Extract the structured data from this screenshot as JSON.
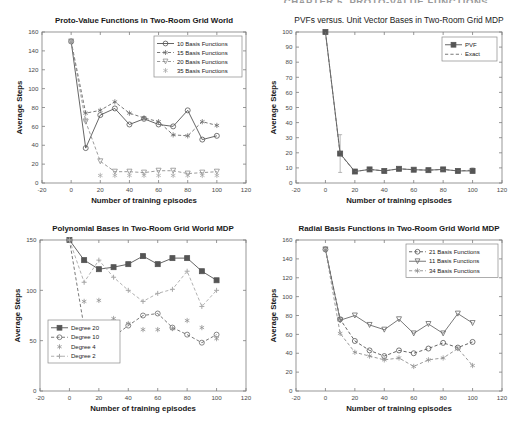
{
  "page": {
    "running_header": "CHAPTER 5.  PROTO-VALUE FUNCTIONS"
  },
  "chart_data": [
    {
      "id": "proto-value-functions",
      "type": "line",
      "title": "Proto-Value Functions in Two-Room Grid World",
      "xlabel": "Number of training episodes",
      "ylabel": "Average Steps",
      "xlim": [
        -20,
        120
      ],
      "ylim": [
        0,
        160
      ],
      "xticks": [
        -20,
        0,
        20,
        40,
        60,
        80,
        100,
        120
      ],
      "yticks": [
        0,
        20,
        40,
        60,
        80,
        100,
        120,
        140,
        160
      ],
      "grid": false,
      "legend_position": "top-right",
      "x": [
        0,
        10,
        20,
        30,
        40,
        50,
        60,
        70,
        80,
        90,
        100
      ],
      "series": [
        {
          "name": "10 Basis Functions",
          "marker": "circle",
          "linestyle": "solid",
          "values": [
            150,
            37,
            72,
            79,
            62,
            68,
            62,
            60,
            77,
            46,
            50
          ]
        },
        {
          "name": "15 Basis Functions",
          "marker": "star",
          "linestyle": "dashed",
          "values": [
            150,
            74,
            77,
            86,
            74,
            69,
            65,
            51,
            50,
            65,
            61
          ]
        },
        {
          "name": "20 Basis Functions",
          "marker": "triangle-down",
          "linestyle": "dashed",
          "values": [
            150,
            65,
            23,
            12,
            12,
            11,
            13,
            13,
            10,
            11,
            12
          ]
        },
        {
          "name": "35 Basis Functions",
          "marker": "star",
          "linestyle": "none",
          "values": [
            150,
            67,
            8,
            8,
            8,
            8,
            8,
            8,
            8,
            8,
            8
          ]
        }
      ]
    },
    {
      "id": "pvfs-vs-unit-vector",
      "type": "line",
      "title": "PVFs versus. Unit Vector Bases in Two-Room Grid MDP",
      "xlabel": "Number of training episodes",
      "ylabel": "Average Steps",
      "xlim": [
        -20,
        120
      ],
      "ylim": [
        0,
        100
      ],
      "xticks": [
        -20,
        0,
        20,
        40,
        60,
        80,
        100,
        120
      ],
      "yticks": [
        0,
        10,
        20,
        30,
        40,
        50,
        60,
        70,
        80,
        90,
        100
      ],
      "grid": false,
      "legend_position": "top-right",
      "x": [
        0,
        10,
        20,
        30,
        40,
        50,
        60,
        70,
        80,
        90,
        100
      ],
      "series": [
        {
          "name": "PVF",
          "marker": "square",
          "linestyle": "solid",
          "values": [
            100,
            19.5,
            7.6,
            9,
            8,
            9.4,
            8.8,
            8.5,
            9,
            8,
            8
          ]
        },
        {
          "name": "Exact",
          "marker": "none",
          "linestyle": "dashed",
          "values": [
            100,
            19,
            7.6,
            9,
            8,
            9.4,
            8.8,
            8.5,
            9,
            8,
            8.5
          ]
        }
      ],
      "errorbars": {
        "x": [
          10,
          100
        ],
        "low": [
          7,
          7
        ],
        "high": [
          32,
          10
        ]
      }
    },
    {
      "id": "polynomial-bases",
      "type": "line",
      "title": "Polynomial Bases in Two-Room Grid World MDP",
      "xlabel": "Number of training episodes",
      "ylabel": "Average Steps",
      "xlim": [
        -20,
        120
      ],
      "ylim": [
        0,
        150
      ],
      "xticks": [
        -20,
        0,
        20,
        40,
        60,
        80,
        100,
        120
      ],
      "yticks": [
        0,
        50,
        100,
        150
      ],
      "grid": false,
      "legend_position": "bottom-left",
      "x": [
        0,
        10,
        20,
        30,
        40,
        50,
        60,
        70,
        80,
        90,
        100
      ],
      "series": [
        {
          "name": "Degree 20",
          "marker": "square",
          "linestyle": "solid",
          "values": [
            150,
            130,
            121,
            123,
            126,
            134,
            126,
            132,
            132,
            119,
            110
          ]
        },
        {
          "name": "Degree 10",
          "marker": "circle",
          "linestyle": "dashed",
          "values": [
            150,
            63,
            66,
            54,
            65,
            75,
            77,
            63,
            56,
            48,
            56
          ]
        },
        {
          "name": "Degree 4",
          "marker": "star",
          "linestyle": "none",
          "values": [
            150,
            89,
            90,
            72,
            67,
            61,
            61,
            62,
            70,
            63,
            52
          ]
        },
        {
          "name": "Degree 2",
          "marker": "plus",
          "linestyle": "dashed",
          "values": [
            150,
            108,
            130,
            113,
            100,
            89,
            97,
            101,
            119,
            84,
            100
          ]
        }
      ]
    },
    {
      "id": "radial-basis-functions",
      "type": "line",
      "title": "Radial Basis Functions in Two-Room Grid World MDP",
      "xlabel": "Number of training episodes",
      "ylabel": "Average Steps",
      "xlim": [
        -20,
        120
      ],
      "ylim": [
        0,
        160
      ],
      "xticks": [
        -20,
        0,
        20,
        40,
        60,
        80,
        100,
        120
      ],
      "yticks": [
        0,
        20,
        40,
        60,
        80,
        100,
        120,
        140,
        160
      ],
      "grid": false,
      "legend_position": "top-right",
      "x": [
        0,
        10,
        20,
        30,
        40,
        50,
        60,
        70,
        80,
        90,
        100
      ],
      "series": [
        {
          "name": "21 Basis Functions",
          "marker": "circle",
          "linestyle": "dashed",
          "values": [
            150,
            76,
            53,
            43,
            37,
            43,
            40,
            45,
            51,
            46,
            52
          ]
        },
        {
          "name": "11 Basis Functions",
          "marker": "triangle-down",
          "linestyle": "solid",
          "values": [
            150,
            75,
            80,
            70,
            65,
            76,
            61,
            71,
            61,
            82,
            72
          ]
        },
        {
          "name": "34 Basis Functions",
          "marker": "star",
          "linestyle": "dashed",
          "values": [
            150,
            61,
            41,
            37,
            33,
            35,
            26,
            33,
            35,
            45,
            27
          ]
        }
      ]
    }
  ]
}
